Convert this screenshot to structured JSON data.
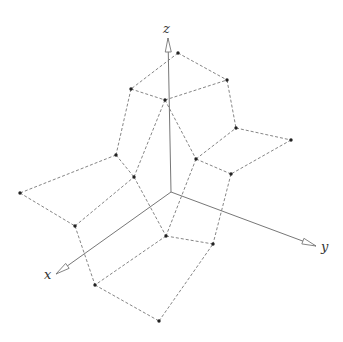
{
  "diagram": {
    "type": "3d-surface-wireframe",
    "axes": {
      "origin": [
        171,
        192
      ],
      "x": {
        "label": "x",
        "tip": [
          56,
          274
        ],
        "label_pos": [
          44,
          268
        ]
      },
      "y": {
        "label": "y",
        "tip": [
          316,
          246
        ],
        "label_pos": [
          321,
          240
        ]
      },
      "z": {
        "label": "z",
        "tip": [
          168,
          38
        ],
        "label_pos": [
          163,
          22
        ]
      }
    },
    "points": {
      "A": [
        178,
        53
      ],
      "B": [
        227,
        80
      ],
      "C": [
        131,
        89
      ],
      "D": [
        165,
        100
      ],
      "E": [
        236,
        128
      ],
      "F": [
        291,
        140
      ],
      "G": [
        196,
        159
      ],
      "H": [
        231,
        174
      ],
      "I": [
        116,
        155
      ],
      "J": [
        134,
        177
      ],
      "K": [
        20,
        193
      ],
      "L": [
        75,
        226
      ],
      "M": [
        166,
        236
      ],
      "N": [
        213,
        244
      ],
      "O": [
        95,
        285
      ],
      "P": [
        159,
        321
      ]
    },
    "edges": [
      [
        "A",
        "B"
      ],
      [
        "A",
        "C"
      ],
      [
        "C",
        "D"
      ],
      [
        "D",
        "B"
      ],
      [
        "B",
        "E"
      ],
      [
        "E",
        "F"
      ],
      [
        "F",
        "H"
      ],
      [
        "H",
        "G"
      ],
      [
        "G",
        "E"
      ],
      [
        "D",
        "G"
      ],
      [
        "C",
        "I"
      ],
      [
        "I",
        "J"
      ],
      [
        "D",
        "J"
      ],
      [
        "I",
        "K"
      ],
      [
        "K",
        "L"
      ],
      [
        "L",
        "J"
      ],
      [
        "J",
        "M"
      ],
      [
        "G",
        "M"
      ],
      [
        "H",
        "N"
      ],
      [
        "M",
        "N"
      ],
      [
        "L",
        "O"
      ],
      [
        "M",
        "O"
      ],
      [
        "O",
        "P"
      ],
      [
        "P",
        "N"
      ]
    ],
    "colors": {
      "axis": "#777777",
      "edge": "#666666",
      "point": "#222222"
    }
  }
}
